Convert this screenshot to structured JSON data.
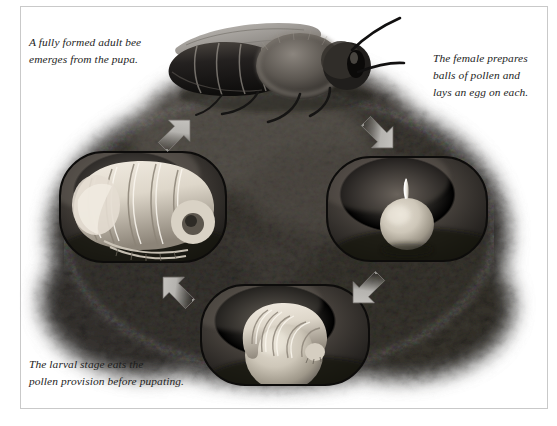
{
  "figure": {
    "palette": {
      "page_background": "#ffffff",
      "frame_border": "#c9c9c9",
      "text": "#1d1d1d",
      "soil_dark": "#2a2724",
      "soil_mid": "#4a4642",
      "soil_light": "#8d8781",
      "cell_interior": "#3a3632",
      "cell_outline": "#0d0c0b",
      "arrow_fill": "#b3b1ad",
      "arrow_shadow": "#6f6d6a",
      "grub_light": "#efe9df",
      "grub_shadow": "#8a8276",
      "pollen_ball": "#cdc6b8",
      "egg_white": "#f4f1ea",
      "bee_body": "#1a1816",
      "bee_fur": "#6e6862",
      "bee_wing": "#a9a5a0"
    }
  },
  "captions": {
    "adult": "A fully formed adult bee\nemerges from the pupa.",
    "female": "The female prepares\nballs of pollen and\nlays an egg on each.",
    "larva": "The larval stage eats the\npollen provision before pupating."
  },
  "cells": {
    "pupa": {
      "label": "pupa-brood-cell"
    },
    "egg": {
      "label": "egg-on-pollen-ball-brood-cell"
    },
    "larva": {
      "label": "larva-on-pollen-provision-brood-cell"
    }
  },
  "arrows": {
    "egg_to_larva": {
      "label": "arrow-egg-to-larva",
      "direction": "down-left"
    },
    "larva_to_pupa": {
      "label": "arrow-larva-to-pupa",
      "direction": "up-left"
    },
    "pupa_to_adult": {
      "label": "arrow-pupa-to-adult",
      "direction": "up-right"
    },
    "adult_to_egg": {
      "label": "arrow-adult-to-egg",
      "direction": "down-right"
    }
  }
}
